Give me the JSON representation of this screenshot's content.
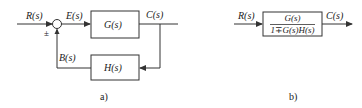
{
  "diagram_a": {
    "caption": "a)",
    "signals": {
      "input": "R(s)",
      "error": "E(s)",
      "output": "C(s)",
      "feedback": "B(s)"
    },
    "sign": "±",
    "blocks": {
      "forward": "G(s)",
      "feedback": "H(s)"
    }
  },
  "diagram_b": {
    "caption": "b)",
    "signals": {
      "input": "R(s)",
      "output": "C(s)"
    },
    "block": {
      "numerator": "G(s)",
      "denominator": "1∓G(s)H(s)"
    }
  },
  "colors": {
    "line": "#333333",
    "background": "#ffffff"
  }
}
